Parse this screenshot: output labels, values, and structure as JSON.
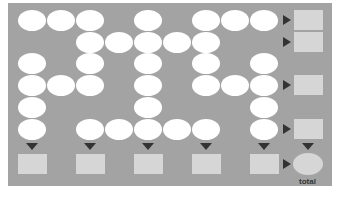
{
  "diagram": {
    "type": "dot-grid-row-column-sum",
    "colors": {
      "background": "#a3a3a3",
      "dot": "#ffffff",
      "result_box": "#d6d6d6",
      "arrow": "#333333"
    },
    "grid": {
      "columns": 9,
      "rows": 6,
      "cells": [
        [
          1,
          1,
          1,
          0,
          1,
          0,
          1,
          1,
          1
        ],
        [
          0,
          0,
          1,
          1,
          1,
          1,
          1,
          0,
          0
        ],
        [
          1,
          0,
          1,
          0,
          1,
          0,
          1,
          0,
          1
        ],
        [
          1,
          1,
          1,
          0,
          1,
          0,
          1,
          1,
          1
        ],
        [
          1,
          0,
          0,
          0,
          1,
          0,
          0,
          0,
          1
        ],
        [
          1,
          0,
          1,
          1,
          1,
          1,
          1,
          0,
          1
        ]
      ]
    },
    "row_outputs": [
      {
        "row": 0,
        "has_arrow": true
      },
      {
        "row": 1,
        "has_arrow": true
      },
      {
        "row": 2,
        "has_arrow": false
      },
      {
        "row": 3,
        "has_arrow": true
      },
      {
        "row": 4,
        "has_arrow": false
      },
      {
        "row": 5,
        "has_arrow": true
      }
    ],
    "column_outputs": [
      0,
      2,
      4,
      6,
      8
    ],
    "total_label": "total"
  }
}
